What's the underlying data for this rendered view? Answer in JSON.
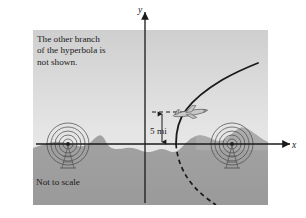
{
  "figure": {
    "title_note": "The other branch of the hyperbola is not shown.",
    "note_lines": [
      "The other branch",
      "of the hyperbola is",
      "not shown."
    ],
    "scale_note": "Not to scale",
    "distance_label": "5 mi",
    "axis": {
      "x_label": "x",
      "y_label": "y"
    },
    "colors": {
      "sky_top": "#d6d6d6",
      "sky_bottom": "#ebebeb",
      "ground": "#9e9e9e",
      "ground_dark": "#8d8d8d",
      "curve": "#1a1a1a",
      "axis": "#1a1a1a",
      "text": "#1a1a1a",
      "page": "#ffffff"
    },
    "panel": {
      "x": 33,
      "y": 30,
      "width": 235,
      "height": 175
    },
    "origin": {
      "x": 145,
      "y": 144
    },
    "stations": [
      {
        "name": "left-radio-station",
        "cx": 68,
        "cy": 144
      },
      {
        "name": "right-radio-station",
        "cx": 232,
        "cy": 144
      }
    ],
    "airplane": {
      "cx": 190,
      "cy": 113
    },
    "altitude_line_y": 112,
    "hyperbola": {
      "solid_branch": "upper-right solid branch",
      "dashed_branch": "lower-right dashed branch",
      "vertex_x": 176
    },
    "icons": {
      "plane": "airplane-icon",
      "tower": "radio-tower-icon",
      "waves": "radio-waves-icon",
      "arrow": "arrow-icon"
    }
  }
}
